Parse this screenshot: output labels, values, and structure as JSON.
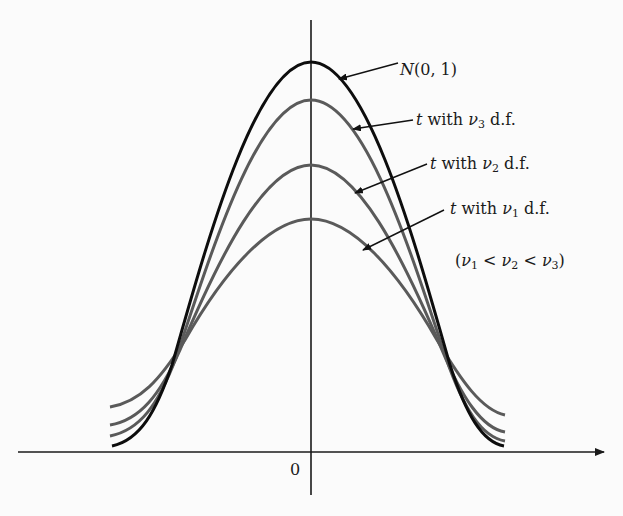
{
  "figure": {
    "origin_label": "0",
    "colors": {
      "normal_curve": "#0d0d0d",
      "t_curves": "#5a5a5a",
      "axes": "#1a1a1a",
      "background": "#fbfbfb"
    },
    "curves": [
      {
        "id": "normal",
        "label_prefix": "N",
        "label_rest": "(0, 1)",
        "peak_y": 62
      },
      {
        "id": "t3",
        "label_t": "t",
        "label_with": " with ",
        "label_nu": "ν",
        "label_sub": "3",
        "label_df": " d.f.",
        "peak_y": 100
      },
      {
        "id": "t2",
        "label_t": "t",
        "label_with": " with ",
        "label_nu": "ν",
        "label_sub": "2",
        "label_df": " d.f.",
        "peak_y": 165
      },
      {
        "id": "t1",
        "label_t": "t",
        "label_with": " with ",
        "label_nu": "ν",
        "label_sub": "1",
        "label_df": " d.f.",
        "peak_y": 219
      }
    ],
    "condition": {
      "open": "(",
      "nu": "ν",
      "sub1": "1",
      "lt": " < ",
      "sub2": "2",
      "sub3": "3",
      "close": ")"
    }
  }
}
